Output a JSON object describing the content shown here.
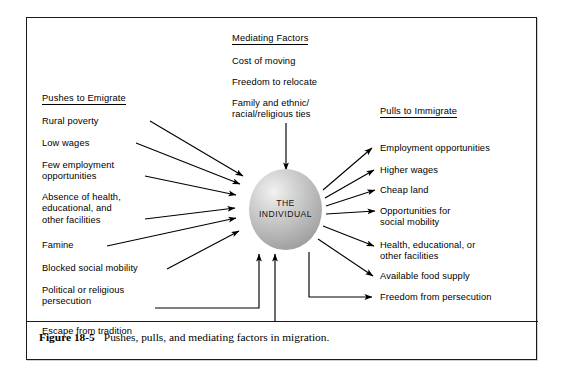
{
  "figure": {
    "caption_label": "Figure 18-5",
    "caption_body": "Pushes, pulls, and mediating factors in migration."
  },
  "center": {
    "line1": "THE",
    "line2": "INDIVIDUAL"
  },
  "mediating": {
    "heading": "Mediating Factors",
    "items": [
      "Cost of moving",
      "Freedom to relocate",
      "Family and ethnic/\nracial/religious ties"
    ]
  },
  "pushes": {
    "heading": "Pushes to Emigrate",
    "items": [
      "Rural poverty",
      "Low wages",
      "Few employment\nopportunities",
      "Absence of health,\neducational, and\nother facilities",
      "Famine",
      "Blocked social mobility",
      "Political or religious\npersecution",
      "Escape from tradition"
    ]
  },
  "pulls": {
    "heading": "Pulls to Immigrate",
    "items": [
      "Employment opportunities",
      "Higher wages",
      "Cheap land",
      "Opportunities for\nsocial mobility",
      "Health, educational, or\nother facilities",
      "Available food supply",
      "Freedom from persecution"
    ]
  },
  "colors": {
    "stroke": "#000000",
    "frame": "#1a1a1a",
    "sphere_light": "#f2f2f2",
    "sphere_dark": "#8e8e8e"
  }
}
